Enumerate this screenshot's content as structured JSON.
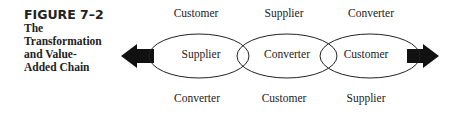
{
  "figure": {
    "number": "FIGURE 7–2",
    "title": "The\nTransformation\nand Value-\nAdded Chain"
  },
  "diagram": {
    "top_labels": [
      "Customer",
      "Supplier",
      "Converter"
    ],
    "ellipse_labels": [
      "Supplier",
      "Converter",
      "Customer"
    ],
    "bottom_labels": [
      "Converter",
      "Customer",
      "Supplier"
    ],
    "arrows": [
      "left-arrow",
      "right-arrow"
    ],
    "colors": {
      "stroke": "#222222",
      "arrow_fill": "#111111"
    }
  }
}
